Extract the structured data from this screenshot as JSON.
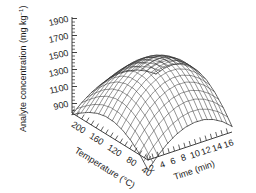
{
  "chart_data": {
    "type": "surface",
    "title": "",
    "zlabel": "Analyte concentration (mg kg",
    "zlabel_sup": "-1",
    "zlabel_tail": ")",
    "xlabel": "Time (min)",
    "ylabel": "Temperature (°C)",
    "zticks": [
      "1900",
      "1700",
      "1500",
      "1300",
      "1100",
      "900"
    ],
    "zlim": [
      700,
      1900
    ],
    "ztick_values": [
      1900,
      1700,
      1500,
      1300,
      1100,
      900
    ],
    "xticks": [
      "2",
      "4",
      "6",
      "8",
      "10",
      "12",
      "14",
      "16"
    ],
    "xtick_values": [
      2,
      4,
      6,
      8,
      10,
      12,
      14,
      16
    ],
    "xlim": [
      0,
      17
    ],
    "yticks": [
      "200",
      "160",
      "120",
      "80",
      "40"
    ],
    "ytick_values": [
      200,
      160,
      120,
      80,
      40
    ],
    "ylim": [
      40,
      200
    ],
    "grid": true,
    "legend": "none",
    "surface_style": "wireframe-mesh",
    "mesh_divisions_x": 17,
    "mesh_divisions_y": 17,
    "peak_value": 1580,
    "peak_time_min": 9,
    "peak_temperature_c": 130,
    "z_matrix_note": "Rows = temperature 200 to 40 degC, columns = time 0 to 17 min",
    "z_matrix": [
      [
        880,
        980,
        1060,
        1120,
        1160,
        1180,
        1175,
        1150,
        1100,
        1030
      ],
      [
        960,
        1080,
        1180,
        1255,
        1305,
        1330,
        1325,
        1295,
        1240,
        1160
      ],
      [
        1030,
        1170,
        1285,
        1370,
        1428,
        1456,
        1452,
        1418,
        1355,
        1262
      ],
      [
        1080,
        1235,
        1362,
        1456,
        1520,
        1552,
        1548,
        1510,
        1440,
        1338
      ],
      [
        1105,
        1268,
        1402,
        1502,
        1568,
        1600,
        1596,
        1556,
        1482,
        1374
      ],
      [
        1100,
        1266,
        1402,
        1502,
        1568,
        1600,
        1596,
        1556,
        1480,
        1370
      ],
      [
        1066,
        1228,
        1360,
        1458,
        1522,
        1552,
        1548,
        1508,
        1434,
        1326
      ],
      [
        1002,
        1154,
        1280,
        1372,
        1432,
        1460,
        1456,
        1416,
        1344,
        1238
      ],
      [
        908,
        1046,
        1162,
        1248,
        1304,
        1330,
        1324,
        1286,
        1218,
        1118
      ],
      [
        784,
        906,
        1010,
        1088,
        1138,
        1160,
        1156,
        1120,
        1058,
        966
      ]
    ]
  },
  "axes": {
    "z": {
      "title_main": "Analyte concentration (mg kg",
      "title_sup": "−1",
      "title_end": ")",
      "ticks": [
        {
          "label": "1900",
          "value": 1900
        },
        {
          "label": "1700",
          "value": 1700
        },
        {
          "label": "1500",
          "value": 1500
        },
        {
          "label": "1300",
          "value": 1300
        },
        {
          "label": "1100",
          "value": 1100
        },
        {
          "label": "900",
          "value": 900
        }
      ]
    },
    "y": {
      "title": "Temperature (°C)",
      "ticks": [
        {
          "label": "200",
          "value": 200
        },
        {
          "label": "160",
          "value": 160
        },
        {
          "label": "120",
          "value": 120
        },
        {
          "label": "80",
          "value": 80
        },
        {
          "label": "40",
          "value": 40
        }
      ]
    },
    "x": {
      "title": "Time (min)",
      "ticks": [
        {
          "label": "2",
          "value": 2
        },
        {
          "label": "4",
          "value": 4
        },
        {
          "label": "6",
          "value": 6
        },
        {
          "label": "8",
          "value": 8
        },
        {
          "label": "10",
          "value": 10
        },
        {
          "label": "12",
          "value": 12
        },
        {
          "label": "14",
          "value": 14
        },
        {
          "label": "16",
          "value": 16
        }
      ]
    }
  },
  "colors": {
    "background": "#ffffff",
    "ink": "#1a1a1a",
    "mesh": "#2b2b2b",
    "axis": "#2b2b2b"
  }
}
